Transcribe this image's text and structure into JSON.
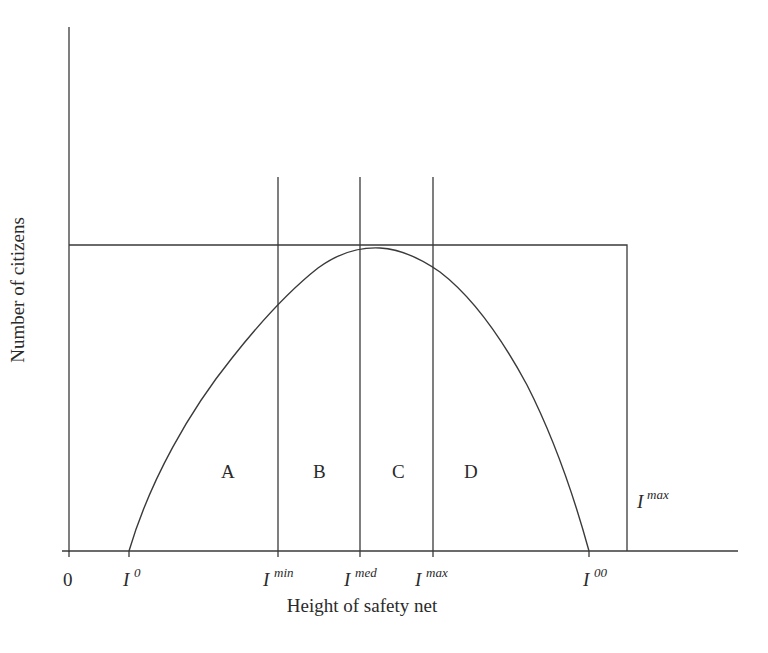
{
  "figure": {
    "y_axis_label": "Number of citizens",
    "x_axis_label": "Height of safety net",
    "origin_label": "0",
    "ticks": [
      {
        "base": "I",
        "sup": "0"
      },
      {
        "base": "I",
        "sup": "min"
      },
      {
        "base": "I",
        "sup": "med"
      },
      {
        "base": "I",
        "sup": "max"
      },
      {
        "base": "I",
        "sup": "00"
      }
    ],
    "regions": [
      "A",
      "B",
      "C",
      "D"
    ],
    "cap_label": {
      "base": "I",
      "sup": "max"
    },
    "colors": {
      "ink": "#3a3a3a",
      "background": "#ffffff"
    }
  }
}
